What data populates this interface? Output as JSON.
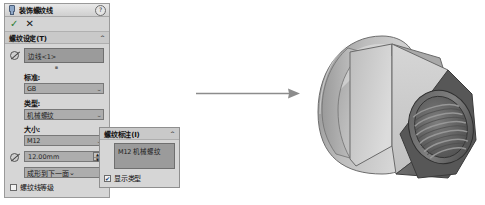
{
  "app": {
    "panel_title": "装饰螺纹线",
    "title_icon": "thread-icon",
    "help_icon": "?",
    "ok_glyph": "✓",
    "cancel_glyph": "✕"
  },
  "thread_settings": {
    "section_label": "螺纹设定(T)",
    "collapse_glyph": "⌃",
    "selection": {
      "icon": "edge-select-icon",
      "value": "边线<1>",
      "hint": ""
    },
    "standard": {
      "label": "标准:",
      "value": "GB"
    },
    "type": {
      "label": "类型:",
      "value": "机械螺纹"
    },
    "size": {
      "label": "大小:",
      "value": "M12"
    },
    "depth": {
      "icon": "depth-icon",
      "value": "12.00mm",
      "spin_up": "▲",
      "spin_down": "▼"
    },
    "end_condition": {
      "value": "成形到下一面"
    },
    "thread_class": {
      "label": "螺纹线等级",
      "checked": false
    },
    "dropdown_glyph": "⌄"
  },
  "thread_callout": {
    "section_label": "螺纹标注(I)",
    "collapse_glyph": "⌃",
    "text_value": "M12 机械螺纹",
    "show_type": {
      "label": "显示类型",
      "checked": true,
      "check_glyph": "✔"
    }
  },
  "arrow": {
    "name": "result-arrow",
    "direction": "right",
    "color": "#8c8c8c"
  },
  "model": {
    "name": "cap-nut-3d-model",
    "description": "M12 domed cap nut with internal thread",
    "body_color": "#b9b9b9",
    "shadow_color": "#4e4e4e",
    "highlight_color": "#e2e2e2"
  }
}
